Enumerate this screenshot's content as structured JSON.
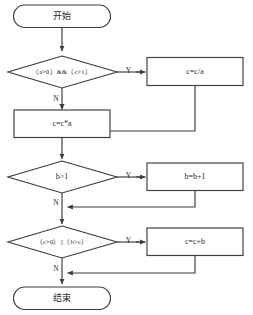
{
  "diagram": {
    "type": "flowchart",
    "title": "",
    "colors": {
      "stroke": "#3c3c3c",
      "fill": "#ffffff",
      "text": "#2b2b2b",
      "background": "#ffffff"
    },
    "nodes": {
      "start": {
        "label": "开始",
        "shape": "terminator"
      },
      "cond1": {
        "label": "（a>0）&&（c>1）",
        "shape": "decision"
      },
      "proc_c_div_a": {
        "label": "c=c/a",
        "shape": "process"
      },
      "proc_c_mul_a": {
        "label": "c=c*a",
        "shape": "process"
      },
      "cond2": {
        "label": "b>1",
        "shape": "decision"
      },
      "proc_b_plus_1": {
        "label": "b=b+1",
        "shape": "process"
      },
      "cond3": {
        "label": "（c>0）||（b>c）",
        "shape": "decision"
      },
      "proc_c_plus_b": {
        "label": "c=c+b",
        "shape": "process"
      },
      "end": {
        "label": "结束",
        "shape": "terminator"
      }
    },
    "edge_labels": {
      "cond1_yes": "Y",
      "cond1_no": "N",
      "cond2_yes": "Y",
      "cond2_no": "N",
      "cond3_yes": "Y",
      "cond3_no": "N"
    }
  }
}
